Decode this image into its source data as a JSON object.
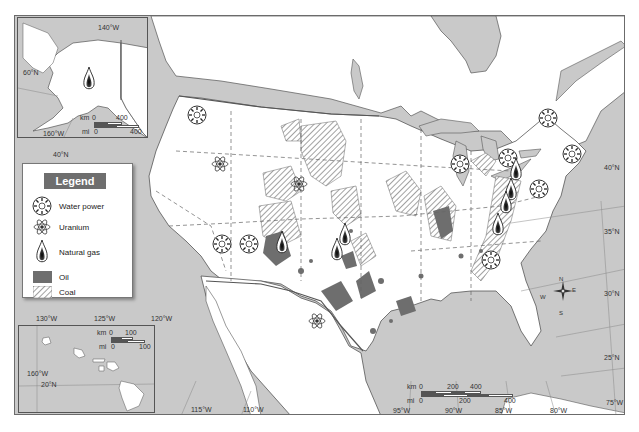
{
  "map": {
    "title_partial": "g",
    "colors": {
      "water": "#c9c9c9",
      "land": "#ffffff",
      "oil": "#6e6e6e",
      "coal_hatch": "#8a8a8a",
      "border": "#555555"
    }
  },
  "legend": {
    "title": "Legend",
    "items": [
      {
        "icon": "water-power-icon",
        "label": "Water power"
      },
      {
        "icon": "uranium-icon",
        "label": "Uranium"
      },
      {
        "icon": "natural-gas-icon",
        "label": "Natural gas"
      },
      {
        "icon": "oil-swatch-icon",
        "label": "Oil"
      },
      {
        "icon": "coal-swatch-icon",
        "label": "Coal"
      }
    ]
  },
  "alaska_inset": {
    "lon_label": "140°W",
    "lat_label": "60°N",
    "lon2_label": "160°W",
    "scale": {
      "km_label": "km",
      "km_zero": "0",
      "km_max": "400",
      "mi_label": "mi",
      "mi_zero": "0",
      "mi_max": "400"
    }
  },
  "hawaii_inset": {
    "lon_label": "160°W",
    "lat_label": "20°N",
    "scale": {
      "km_label": "km",
      "km_zero": "0",
      "km_max": "100",
      "mi_label": "mi",
      "mi_zero": "0",
      "mi_max": "100"
    }
  },
  "main_scale": {
    "km_label": "km",
    "km_zero": "0",
    "km_mid": "200",
    "km_max": "400",
    "mi_label": "mi",
    "mi_zero": "0",
    "mi_mid": "200",
    "mi_max": "400"
  },
  "graticule": {
    "longitudes_bottom": [
      "115°W",
      "110°W",
      "95°W",
      "90°W",
      "85°W",
      "80°W",
      "75°W"
    ],
    "longitudes_left": [
      "130°W",
      "125°W",
      "120°W"
    ],
    "latitudes_right": [
      "40°N",
      "35°N",
      "30°N",
      "25°N"
    ],
    "lat_40_left": "40°N"
  },
  "compass": {
    "n": "N",
    "s": "S",
    "e": "E",
    "w": "W"
  }
}
